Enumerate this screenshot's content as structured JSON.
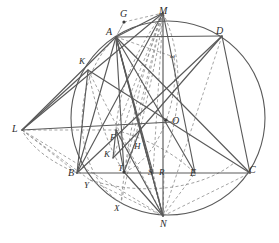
{
  "figure": {
    "stroke_solid": "#5a5a5a",
    "stroke_dashed": "#8e8e8e",
    "label_color": "#2b2b2b",
    "background": "#ffffff",
    "circle": {
      "cx": 168,
      "cy": 118,
      "r": 97
    }
  },
  "labels": [
    {
      "id": "G",
      "text": "G",
      "x": 120,
      "y": 9,
      "size": 10
    },
    {
      "id": "M",
      "text": "M",
      "x": 159,
      "y": 6,
      "size": 10
    },
    {
      "id": "A",
      "text": "A",
      "x": 106,
      "y": 27,
      "size": 10
    },
    {
      "id": "D",
      "text": "D",
      "x": 216,
      "y": 26,
      "size": 10
    },
    {
      "id": "Kup",
      "text": "K",
      "x": 79,
      "y": 57,
      "size": 9
    },
    {
      "id": "w",
      "text": "ω",
      "x": 170,
      "y": 53,
      "size": 7
    },
    {
      "id": "L",
      "text": "L",
      "x": 12,
      "y": 124,
      "size": 10
    },
    {
      "id": "O",
      "text": "O",
      "x": 172,
      "y": 116,
      "size": 10
    },
    {
      "id": "F",
      "text": "F",
      "x": 110,
      "y": 133,
      "size": 9
    },
    {
      "id": "H",
      "text": "H",
      "x": 134,
      "y": 142,
      "size": 9
    },
    {
      "id": "Klo",
      "text": "K",
      "x": 104,
      "y": 150,
      "size": 9
    },
    {
      "id": "T",
      "text": "T",
      "x": 118,
      "y": 164,
      "size": 9
    },
    {
      "id": "B",
      "text": "B",
      "x": 68,
      "y": 168,
      "size": 10
    },
    {
      "id": "S",
      "text": "S",
      "x": 148,
      "y": 168,
      "size": 9
    },
    {
      "id": "R",
      "text": "R",
      "x": 159,
      "y": 168,
      "size": 9
    },
    {
      "id": "E",
      "text": "E",
      "x": 190,
      "y": 168,
      "size": 10
    },
    {
      "id": "C",
      "text": "C",
      "x": 249,
      "y": 165,
      "size": 10
    },
    {
      "id": "Y",
      "text": "Y",
      "x": 84,
      "y": 181,
      "size": 9
    },
    {
      "id": "X",
      "text": "X",
      "x": 114,
      "y": 204,
      "size": 9
    },
    {
      "id": "N",
      "text": "N",
      "x": 160,
      "y": 219,
      "size": 10
    }
  ],
  "points": [
    {
      "id": "G",
      "x": 124,
      "y": 22,
      "dot": true
    },
    {
      "id": "M",
      "x": 163,
      "y": 13,
      "dot": false
    },
    {
      "id": "A",
      "x": 116,
      "y": 37,
      "dot": false
    },
    {
      "id": "D",
      "x": 222,
      "y": 36,
      "dot": false
    },
    {
      "id": "K_up",
      "x": 88,
      "y": 70,
      "dot": false
    },
    {
      "id": "L",
      "x": 22,
      "y": 130,
      "dot": false
    },
    {
      "id": "O",
      "x": 166,
      "y": 120,
      "dot": true
    },
    {
      "id": "F",
      "x": 116,
      "y": 130,
      "dot": false
    },
    {
      "id": "H",
      "x": 140,
      "y": 130,
      "dot": false
    },
    {
      "id": "K_lo",
      "x": 113,
      "y": 158,
      "dot": false
    },
    {
      "id": "T",
      "x": 124,
      "y": 172,
      "dot": true
    },
    {
      "id": "B",
      "x": 77,
      "y": 173,
      "dot": false
    },
    {
      "id": "S",
      "x": 153,
      "y": 173,
      "dot": false
    },
    {
      "id": "R",
      "x": 164,
      "y": 173,
      "dot": false
    },
    {
      "id": "E",
      "x": 195,
      "y": 173,
      "dot": false
    },
    {
      "id": "C",
      "x": 250,
      "y": 173,
      "dot": false
    },
    {
      "id": "Y",
      "x": 90,
      "y": 180,
      "dot": false
    },
    {
      "id": "X",
      "x": 121,
      "y": 203,
      "dot": false
    },
    {
      "id": "N",
      "x": 163,
      "y": 216,
      "dot": false
    }
  ],
  "solid_segments": [
    {
      "name": "A-M",
      "x1": 116,
      "y1": 37,
      "x2": 163,
      "y2": 13
    },
    {
      "name": "A-D",
      "x1": 116,
      "y1": 37,
      "x2": 222,
      "y2": 36
    },
    {
      "name": "M-N",
      "x1": 163,
      "y1": 13,
      "x2": 163,
      "y2": 216
    },
    {
      "name": "M-B",
      "x1": 163,
      "y1": 13,
      "x2": 77,
      "y2": 173
    },
    {
      "name": "M-L",
      "x1": 163,
      "y1": 13,
      "x2": 22,
      "y2": 130
    },
    {
      "name": "D-C",
      "x1": 222,
      "y1": 36,
      "x2": 250,
      "y2": 173
    },
    {
      "name": "D-H",
      "x1": 222,
      "y1": 36,
      "x2": 140,
      "y2": 130
    },
    {
      "name": "B-C",
      "x1": 77,
      "y1": 173,
      "x2": 250,
      "y2": 173
    },
    {
      "name": "L-O",
      "x1": 22,
      "y1": 130,
      "x2": 172,
      "y2": 122
    },
    {
      "name": "L-K",
      "x1": 22,
      "y1": 130,
      "x2": 88,
      "y2": 70
    },
    {
      "name": "L-A",
      "x1": 22,
      "y1": 130,
      "x2": 116,
      "y2": 37
    },
    {
      "name": "K-C",
      "x1": 88,
      "y1": 70,
      "x2": 250,
      "y2": 173
    },
    {
      "name": "A-B",
      "x1": 116,
      "y1": 37,
      "x2": 77,
      "y2": 173
    },
    {
      "name": "A-N",
      "x1": 116,
      "y1": 37,
      "x2": 163,
      "y2": 216
    },
    {
      "name": "A-T",
      "x1": 116,
      "y1": 37,
      "x2": 124,
      "y2": 172
    },
    {
      "name": "A-E",
      "x1": 116,
      "y1": 37,
      "x2": 195,
      "y2": 173
    },
    {
      "name": "A-S",
      "x1": 116,
      "y1": 37,
      "x2": 153,
      "y2": 173
    },
    {
      "name": "A-H",
      "x1": 116,
      "y1": 37,
      "x2": 140,
      "y2": 130
    },
    {
      "name": "A-C",
      "x1": 116,
      "y1": 37,
      "x2": 250,
      "y2": 173
    },
    {
      "name": "F-N",
      "x1": 116,
      "y1": 130,
      "x2": 163,
      "y2": 216
    },
    {
      "name": "F-K",
      "x1": 116,
      "y1": 130,
      "x2": 113,
      "y2": 158
    },
    {
      "name": "K-H",
      "x1": 113,
      "y1": 158,
      "x2": 140,
      "y2": 130
    },
    {
      "name": "H-T",
      "x1": 140,
      "y1": 130,
      "x2": 124,
      "y2": 172
    },
    {
      "name": "H-N",
      "x1": 140,
      "y1": 130,
      "x2": 163,
      "y2": 216
    },
    {
      "name": "T-N",
      "x1": 124,
      "y1": 172,
      "x2": 163,
      "y2": 216
    },
    {
      "name": "F-T",
      "x1": 116,
      "y1": 130,
      "x2": 124,
      "y2": 172
    },
    {
      "name": "B-D",
      "x1": 77,
      "y1": 173,
      "x2": 222,
      "y2": 36
    },
    {
      "name": "K-B",
      "x1": 88,
      "y1": 70,
      "x2": 77,
      "y2": 173
    },
    {
      "name": "M-E",
      "x1": 163,
      "y1": 13,
      "x2": 195,
      "y2": 173
    }
  ],
  "dashed_segments": [
    {
      "name": "G-M",
      "x1": 124,
      "y1": 22,
      "x2": 163,
      "y2": 13
    },
    {
      "name": "G-A",
      "x1": 124,
      "y1": 22,
      "x2": 116,
      "y2": 37
    },
    {
      "name": "L-B",
      "x1": 22,
      "y1": 130,
      "x2": 77,
      "y2": 173
    },
    {
      "name": "L-Y",
      "x1": 22,
      "y1": 130,
      "x2": 90,
      "y2": 180
    },
    {
      "name": "L-N",
      "x1": 22,
      "y1": 130,
      "x2": 163,
      "y2": 216
    },
    {
      "name": "L-F",
      "x1": 22,
      "y1": 130,
      "x2": 116,
      "y2": 130
    },
    {
      "name": "M-K",
      "x1": 163,
      "y1": 13,
      "x2": 113,
      "y2": 158
    },
    {
      "name": "M-F",
      "x1": 163,
      "y1": 13,
      "x2": 116,
      "y2": 130
    },
    {
      "name": "M-T",
      "x1": 163,
      "y1": 13,
      "x2": 124,
      "y2": 172
    },
    {
      "name": "M-X",
      "x1": 163,
      "y1": 13,
      "x2": 121,
      "y2": 203
    },
    {
      "name": "M-S",
      "x1": 163,
      "y1": 13,
      "x2": 153,
      "y2": 173
    },
    {
      "name": "D-N",
      "x1": 222,
      "y1": 36,
      "x2": 163,
      "y2": 216
    },
    {
      "name": "N-C",
      "x1": 163,
      "y1": 216,
      "x2": 250,
      "y2": 173
    },
    {
      "name": "N-E",
      "x1": 163,
      "y1": 216,
      "x2": 195,
      "y2": 173
    },
    {
      "name": "N-R",
      "x1": 163,
      "y1": 216,
      "x2": 164,
      "y2": 173
    },
    {
      "name": "N-S",
      "x1": 163,
      "y1": 216,
      "x2": 153,
      "y2": 173
    },
    {
      "name": "N-H",
      "x1": 163,
      "y1": 216,
      "x2": 140,
      "y2": 130
    },
    {
      "name": "A-w",
      "x1": 116,
      "y1": 37,
      "x2": 174,
      "y2": 57
    },
    {
      "name": "A-G",
      "x1": 116,
      "y1": 37,
      "x2": 124,
      "y2": 22
    },
    {
      "name": "Y-N",
      "x1": 90,
      "y1": 180,
      "x2": 163,
      "y2": 216
    },
    {
      "name": "K-N",
      "x1": 88,
      "y1": 70,
      "x2": 163,
      "y2": 216
    }
  ],
  "dashed_arcs": [
    {
      "name": "arc-A-N-left",
      "d": "M 116 37 C 70 80 70 170 121 203"
    },
    {
      "name": "arc-M-F",
      "d": "M 163 13 C 132 55 118 95 116 130"
    },
    {
      "name": "arc-M-X",
      "d": "M 163 13 C 140 70 126 150 121 203"
    },
    {
      "name": "arc-omega",
      "d": "M 163 13 C 186 60 180 120 163 160"
    },
    {
      "name": "arc-H-up",
      "d": "M 140 130 C 150 85 160 45 163 13"
    },
    {
      "name": "arc-T-right",
      "d": "M 124 172 C 158 160 180 100 174 57"
    },
    {
      "name": "arc-Y-right",
      "d": "M 90 180 C 140 196 200 190 234 163"
    },
    {
      "name": "arc-B-L",
      "d": "M 77 173 C 50 162 30 146 22 130"
    },
    {
      "name": "arc-K-T",
      "d": "M 88 70 C 96 110 108 148 124 172"
    },
    {
      "name": "arc-F-right",
      "d": "M 116 130 C 148 140 170 150 195 173"
    }
  ],
  "caption": ""
}
